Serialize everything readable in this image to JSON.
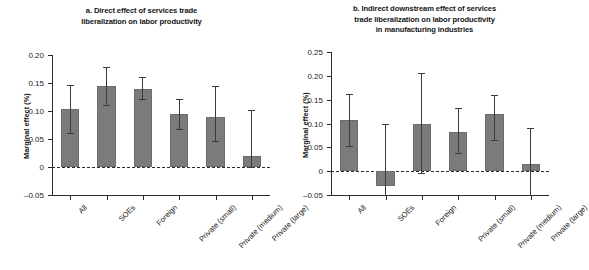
{
  "figure": {
    "background": "#ffffff",
    "bar_color": "#7b7b7b",
    "axis_color": "#2b2b2b",
    "error_color": "#3a3a3a"
  },
  "chart_data": [
    {
      "type": "bar",
      "panel": "a",
      "title": "a. Direct effect of services trade liberalization on labor productivity",
      "title_lines": [
        "a. Direct effect of services trade",
        "liberalization on labor productivity"
      ],
      "xlabel": "",
      "ylabel": "Marginal effect (%)",
      "ylim": [
        -0.05,
        0.2
      ],
      "yticks": [
        0.2,
        0.15,
        0.1,
        0.05,
        0,
        -0.05
      ],
      "ytick_labels": [
        "0.20",
        "0.15",
        "0.10",
        "0.05",
        "0",
        "–0.05"
      ],
      "grid": false,
      "legend": "none",
      "zero_line": true,
      "categories": [
        "All",
        "SOEs",
        "Foreign",
        "Private (small)",
        "Private (medium)",
        "Private (large)"
      ],
      "values": [
        0.103,
        0.144,
        0.14,
        0.095,
        0.089,
        0.019
      ],
      "error_low": [
        0.06,
        0.111,
        0.122,
        0.068,
        0.046,
        0.0
      ],
      "error_high": [
        0.147,
        0.178,
        0.161,
        0.122,
        0.144,
        0.101
      ]
    },
    {
      "type": "bar",
      "panel": "b",
      "title": "b. Indirect downstream effect of services trade liberalization on labor productivity in manufacturing industries",
      "title_lines": [
        "b. Indirect downstream effect of services",
        "trade liberalization on labor productivity",
        "in manufacturing industries"
      ],
      "xlabel": "",
      "ylabel": "Marginal effect (%)",
      "ylim": [
        -0.05,
        0.25
      ],
      "yticks": [
        0.25,
        0.2,
        0.15,
        0.1,
        0.05,
        0,
        -0.05
      ],
      "ytick_labels": [
        "0.25",
        "0.20",
        "0.15",
        "0.10",
        "0.05",
        "0",
        "–0.05"
      ],
      "grid": false,
      "legend": "none",
      "zero_line": true,
      "categories": [
        "All",
        "SOEs",
        "Foreign",
        "Private (small)",
        "Private (medium)",
        "Private (large)"
      ],
      "values": [
        0.107,
        -0.032,
        0.1,
        0.082,
        0.12,
        0.015
      ],
      "error_low": [
        0.053,
        -0.05,
        -0.003,
        0.038,
        0.065,
        -0.05
      ],
      "error_high": [
        0.162,
        0.1,
        0.205,
        0.133,
        0.16,
        0.09
      ]
    }
  ]
}
